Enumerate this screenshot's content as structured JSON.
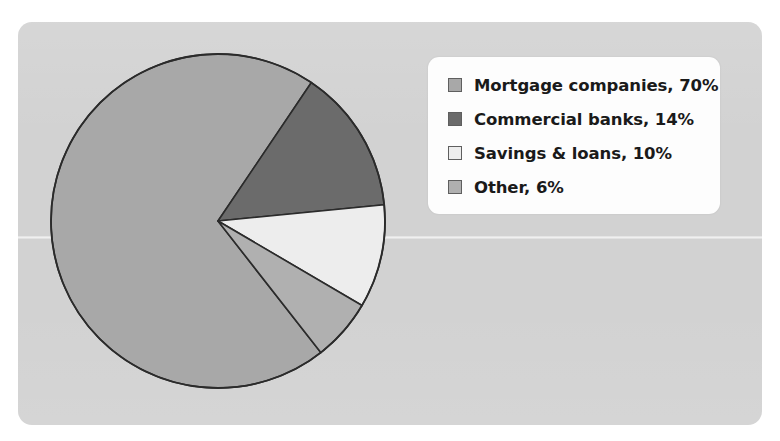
{
  "figure": {
    "panel_color": "#d2d2d2",
    "page_background": "#ffffff",
    "legend_background": "#fdfdfd"
  },
  "chart_data": {
    "type": "pie",
    "title": "",
    "subtitle": "",
    "xlabel": "",
    "ylabel": "",
    "legend_position": "top-right",
    "grid": false,
    "start_angle_deg": 34,
    "direction": "clockwise",
    "categories": [
      "Mortgage companies",
      "Commercial banks",
      "Savings & loans",
      "Other"
    ],
    "values": [
      70,
      14,
      10,
      6
    ],
    "value_unit": "%",
    "colors": [
      "#a8a8a8",
      "#6b6b6b",
      "#ededed",
      "#b0b0b0"
    ],
    "slice_outline_color": "#2b2b2b",
    "slices": [
      {
        "label": "Mortgage companies",
        "value": 70,
        "display": "Mortgage companies, 70%",
        "color": "#a8a8a8",
        "start_deg": 142,
        "end_deg": 394
      },
      {
        "label": "Commercial banks",
        "value": 14,
        "display": "Commercial banks, 14%",
        "color": "#6b6b6b",
        "start_deg": 34,
        "end_deg": 84.4
      },
      {
        "label": "Savings & loans",
        "value": 10,
        "display": "Savings & loans, 10%",
        "color": "#ededed",
        "start_deg": 84.4,
        "end_deg": 120.4
      },
      {
        "label": "Other",
        "value": 6,
        "display": "Other, 6%",
        "color": "#b0b0b0",
        "start_deg": 120.4,
        "end_deg": 142
      }
    ]
  },
  "legend": {
    "items": [
      {
        "label": "Mortgage companies, 70%",
        "color": "#a8a8a8"
      },
      {
        "label": "Commercial banks, 14%",
        "color": "#6b6b6b"
      },
      {
        "label": "Savings & loans, 10%",
        "color": "#ededed"
      },
      {
        "label": "Other, 6%",
        "color": "#b0b0b0"
      }
    ]
  }
}
